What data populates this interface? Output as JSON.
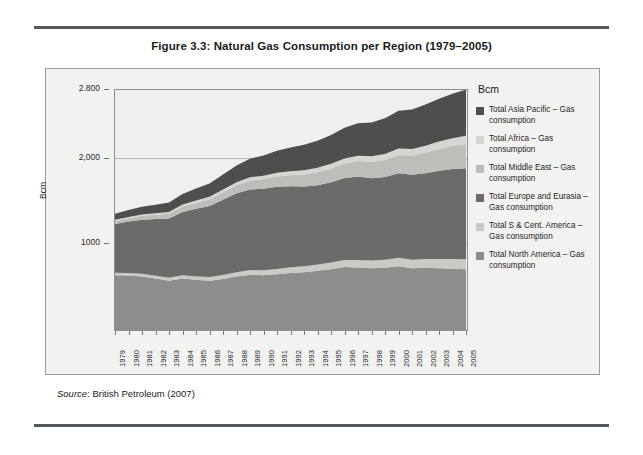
{
  "figure": {
    "title": "Figure 3.3: Natural Gas Consumption per Region (1979–2005)",
    "source_label": "Source",
    "source_text": ": British Petroleum (2007)"
  },
  "chart_data": {
    "type": "area",
    "stacked": true,
    "title": "Figure 3.3: Natural Gas Consumption per Region (1979–2005)",
    "xlabel": "",
    "ylabel": "Bcm",
    "legend_title": "Bcm",
    "legend_position": "right",
    "grid": true,
    "ylim": [
      0,
      2800
    ],
    "ytick_labels": [
      "2.800",
      "2,000",
      "1000"
    ],
    "ytick_values": [
      2800,
      2000,
      1000
    ],
    "x": [
      1979,
      1980,
      1981,
      1982,
      1983,
      1984,
      1985,
      1986,
      1987,
      1988,
      1989,
      1990,
      1991,
      1992,
      1993,
      1994,
      1995,
      1996,
      1997,
      1998,
      1999,
      2000,
      2001,
      2002,
      2003,
      2004,
      2005
    ],
    "categories": [
      "1979",
      "1980",
      "1981",
      "1982",
      "1983",
      "1984",
      "1985",
      "1986",
      "1987",
      "1988",
      "1989",
      "1990",
      "1991",
      "1992",
      "1993",
      "1994",
      "1995",
      "1996",
      "1997",
      "1998",
      "1999",
      "2000",
      "2001",
      "2002",
      "2003",
      "2004",
      "2005"
    ],
    "series": [
      {
        "name": "Total North America – Gas consumption",
        "color": "#8d8d8d",
        "values": [
          640,
          635,
          625,
          600,
          575,
          600,
          585,
          575,
          595,
          625,
          645,
          640,
          650,
          665,
          675,
          690,
          710,
          735,
          730,
          720,
          725,
          745,
          720,
          725,
          720,
          715,
          710
        ]
      },
      {
        "name": "Total S & Cent. America – Gas consumption",
        "color": "#c9c9c5",
        "values": [
          28,
          30,
          32,
          34,
          36,
          38,
          40,
          42,
          46,
          50,
          54,
          58,
          62,
          66,
          70,
          74,
          78,
          82,
          86,
          90,
          94,
          98,
          100,
          104,
          108,
          112,
          116
        ]
      },
      {
        "name": "Total Europe and Eurasia – Gas consumption",
        "color": "#6b6b6b",
        "values": [
          570,
          600,
          630,
          660,
          690,
          740,
          790,
          830,
          880,
          920,
          940,
          950,
          960,
          945,
          930,
          925,
          935,
          955,
          975,
          960,
          965,
          985,
          990,
          1000,
          1030,
          1050,
          1060
        ]
      },
      {
        "name": "Total Middle East – Gas consumption",
        "color": "#bdbdb9",
        "values": [
          35,
          40,
          45,
          50,
          55,
          62,
          70,
          78,
          86,
          95,
          105,
          112,
          120,
          130,
          140,
          150,
          160,
          170,
          180,
          190,
          200,
          215,
          225,
          240,
          255,
          270,
          285
        ]
      },
      {
        "name": "Total Africa – Gas consumption",
        "color": "#d5d5d1",
        "values": [
          12,
          14,
          16,
          18,
          20,
          23,
          26,
          29,
          32,
          35,
          38,
          41,
          44,
          47,
          50,
          53,
          56,
          59,
          62,
          66,
          70,
          74,
          78,
          82,
          86,
          90,
          94
        ]
      },
      {
        "name": "Total Asia Pacific – Gas consumption",
        "color": "#4e4e4e",
        "values": [
          70,
          80,
          90,
          100,
          112,
          125,
          140,
          155,
          175,
          195,
          215,
          235,
          255,
          275,
          295,
          315,
          335,
          360,
          380,
          395,
          415,
          440,
          460,
          480,
          500,
          520,
          540
        ]
      }
    ]
  }
}
